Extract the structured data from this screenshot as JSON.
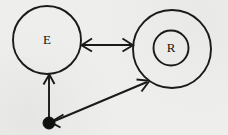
{
  "diagram": {
    "type": "state-transition-diagram",
    "background_color": "#eeeeec",
    "stroke_color": "#1a1a1a",
    "nodes": [
      {
        "id": "E",
        "label": "E",
        "shape": "circle",
        "double": false,
        "cx": 47,
        "cy": 40,
        "r": 34
      },
      {
        "id": "R",
        "label": "R",
        "shape": "circle",
        "double": true,
        "cx": 172,
        "cy": 49,
        "r": 39,
        "r_inner": 17.5
      }
    ],
    "initial_marker": {
      "name": "filled-dot",
      "cx": 49,
      "cy": 123,
      "r": 6
    },
    "edges": [
      {
        "id": "e-r-bidirectional",
        "from": "E",
        "to": "R",
        "direction": "both",
        "label": ""
      },
      {
        "id": "dot-to-e",
        "from": "filled-dot",
        "to": "E",
        "direction": "up",
        "label": ""
      },
      {
        "id": "dot-r-bidirectional",
        "from": "filled-dot",
        "to": "R",
        "direction": "both",
        "label": ""
      }
    ]
  }
}
